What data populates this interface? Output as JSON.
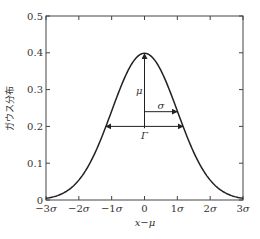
{
  "chart_data": {
    "type": "line",
    "title": "",
    "xlabel": "x−μ",
    "ylabel": "ガウス分布",
    "x_ticks": [
      "−3σ",
      "−2σ",
      "−1σ",
      "0",
      "1σ",
      "2σ",
      "3σ"
    ],
    "x_tick_values": [
      -3,
      -2,
      -1,
      0,
      1,
      2,
      3
    ],
    "y_ticks": [
      "0",
      "0.1",
      "0.2",
      "0.3",
      "0.4",
      "0.5"
    ],
    "y_tick_values": [
      0,
      0.1,
      0.2,
      0.3,
      0.4,
      0.5
    ],
    "xlim": [
      -3,
      3
    ],
    "ylim": [
      0,
      0.5
    ],
    "grid": false,
    "series": [
      {
        "name": "Gaussian",
        "function": "exp(-x^2/2)/sqrt(2*pi)",
        "x": [
          -3,
          -2.5,
          -2,
          -1.5,
          -1,
          -0.5,
          0,
          0.5,
          1,
          1.5,
          2,
          2.5,
          3
        ],
        "values": [
          0.004,
          0.018,
          0.054,
          0.13,
          0.242,
          0.352,
          0.399,
          0.352,
          0.242,
          0.13,
          0.054,
          0.018,
          0.004
        ]
      }
    ],
    "annotations": [
      {
        "label": "μ",
        "type": "vertical-arrow",
        "x": 0,
        "from_y": 0.2,
        "to_y": 0.4
      },
      {
        "label": "σ",
        "type": "horizontal-arrow",
        "y": 0.24,
        "from_x": 0,
        "to_x": 1
      },
      {
        "label": "Γ",
        "type": "double-arrow",
        "y": 0.2,
        "from_x": -1.177,
        "to_x": 1.177
      }
    ]
  }
}
